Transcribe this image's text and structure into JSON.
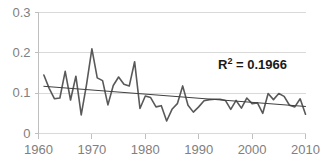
{
  "chart_data": {
    "type": "line",
    "title": "",
    "xlabel": "",
    "ylabel": "",
    "xlim": [
      1960,
      2010
    ],
    "ylim": [
      0,
      0.3
    ],
    "grid": true,
    "legend": false,
    "y_ticks": [
      "0.3",
      "0.2",
      "0.1",
      "0"
    ],
    "y_tick_values": [
      0.3,
      0.2,
      0.1,
      0
    ],
    "x_ticks": [
      "1960",
      "1970",
      "1980",
      "1990",
      "2000",
      "2010"
    ],
    "x_tick_values": [
      1960,
      1970,
      1980,
      1990,
      2000,
      2010
    ],
    "annotations": [
      {
        "name": "r-squared",
        "prefix": "R",
        "superscript": "2",
        "text": " = 0.1966",
        "full_text": "R2 = 0.1966",
        "value": 0.1966
      }
    ],
    "series": [
      {
        "name": "observed",
        "type": "line",
        "color": "#595959",
        "x": [
          1961,
          1962,
          1963,
          1964,
          1965,
          1966,
          1967,
          1968,
          1969,
          1970,
          1971,
          1972,
          1973,
          1974,
          1975,
          1976,
          1977,
          1978,
          1979,
          1980,
          1981,
          1982,
          1983,
          1984,
          1985,
          1986,
          1987,
          1988,
          1989,
          1990,
          1991,
          1992,
          1993,
          1994,
          1995,
          1996,
          1997,
          1998,
          1999,
          2000,
          2001,
          2002,
          2003,
          2004,
          2005,
          2006,
          2007,
          2008,
          2009,
          2010
        ],
        "values": [
          0.145,
          0.112,
          0.086,
          0.088,
          0.154,
          0.083,
          0.142,
          0.046,
          0.122,
          0.21,
          0.138,
          0.131,
          0.071,
          0.119,
          0.14,
          0.122,
          0.118,
          0.178,
          0.062,
          0.093,
          0.089,
          0.066,
          0.069,
          0.031,
          0.06,
          0.074,
          0.118,
          0.07,
          0.053,
          0.066,
          0.081,
          0.084,
          0.085,
          0.085,
          0.082,
          0.06,
          0.082,
          0.063,
          0.088,
          0.074,
          0.076,
          0.05,
          0.099,
          0.084,
          0.099,
          0.092,
          0.07,
          0.066,
          0.086,
          0.048
        ]
      },
      {
        "name": "linear-trendline",
        "type": "line",
        "color": "#404040",
        "x": [
          1961,
          2010
        ],
        "values": [
          0.117,
          0.067
        ]
      }
    ]
  },
  "colors": {
    "series_line": "#595959",
    "trend_line": "#404040",
    "gridline": "#d9d9d9",
    "axis": "#bfbfbf",
    "tick_text": "#808080",
    "annotation_text": "#1a1a1a",
    "background": "#ffffff"
  }
}
